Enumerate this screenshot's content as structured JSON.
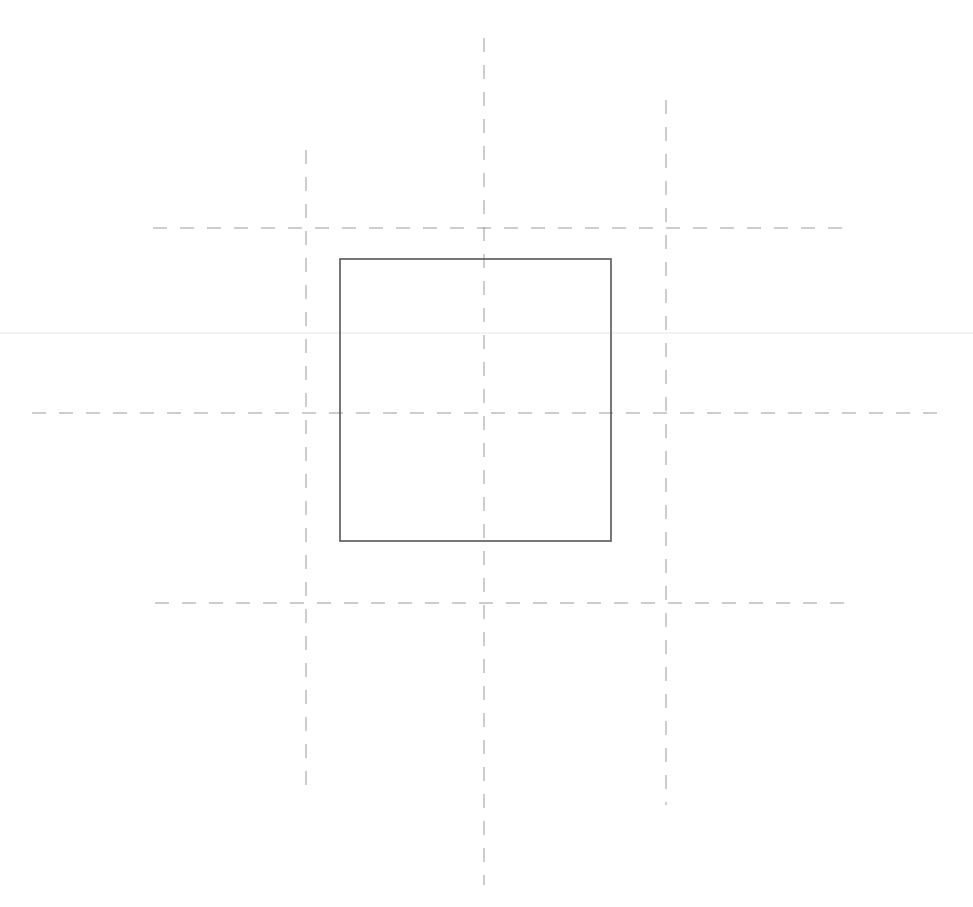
{
  "canvas": {
    "width": 973,
    "height": 907,
    "background": "#ffffff"
  },
  "colors": {
    "rectangle_stroke": "#555555",
    "guide_stroke": "#9a9a9a",
    "faint_line": "#e6e6e6"
  },
  "rectangle": {
    "x": 340,
    "y": 259,
    "width": 271,
    "height": 282,
    "stroke_width": 1.6
  },
  "faint_line": {
    "x1": 0,
    "y1": 333,
    "x2": 973,
    "y2": 333
  },
  "guides": {
    "horizontal": [
      {
        "id": "top",
        "x1": 153,
        "y1": 228,
        "x2": 853,
        "y2": 228
      },
      {
        "id": "middle",
        "x1": 32,
        "y1": 413,
        "x2": 942,
        "y2": 413
      },
      {
        "id": "bottom",
        "x1": 155,
        "y1": 603,
        "x2": 855,
        "y2": 603
      }
    ],
    "vertical": [
      {
        "id": "left",
        "x1": 306,
        "y1": 150,
        "x2": 306,
        "y2": 795
      },
      {
        "id": "center",
        "x1": 484,
        "y1": 38,
        "x2": 484,
        "y2": 885
      },
      {
        "id": "right",
        "x1": 666,
        "y1": 100,
        "x2": 666,
        "y2": 805
      }
    ],
    "dash": "14 13",
    "stroke_width": 1
  }
}
